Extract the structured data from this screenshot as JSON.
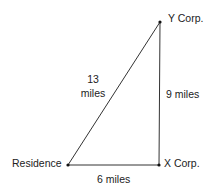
{
  "diagram": {
    "type": "right-triangle-distance-map",
    "line_color": "#333333",
    "nodes": [
      {
        "id": "residence",
        "label": "Residence",
        "x": 68,
        "y": 165
      },
      {
        "id": "x_corp",
        "label": "X Corp.",
        "x": 159,
        "y": 165
      },
      {
        "id": "y_corp",
        "label": "Y Corp.",
        "x": 160,
        "y": 22
      }
    ],
    "edges": [
      {
        "from": "residence",
        "to": "x_corp",
        "label": "6 miles"
      },
      {
        "from": "x_corp",
        "to": "y_corp",
        "label": "9 miles"
      },
      {
        "from": "residence",
        "to": "y_corp",
        "label_line1": "13",
        "label_line2": "miles"
      }
    ]
  }
}
